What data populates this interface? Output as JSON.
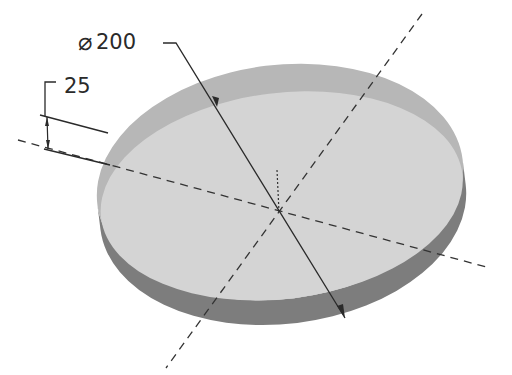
{
  "drawing": {
    "type": "isometric-disc",
    "diameter": {
      "symbol": "⌀",
      "value": "200"
    },
    "thickness": {
      "value": "25"
    },
    "colors": {
      "background": "#ffffff",
      "top_face": "#c9c9c9",
      "top_face_inner": "#d6d6d6",
      "top_rim": "#b4b4b4",
      "side_face": "#7a7a7a",
      "lines": "#2a2a2a",
      "centerline": "#3a3a3a"
    }
  }
}
